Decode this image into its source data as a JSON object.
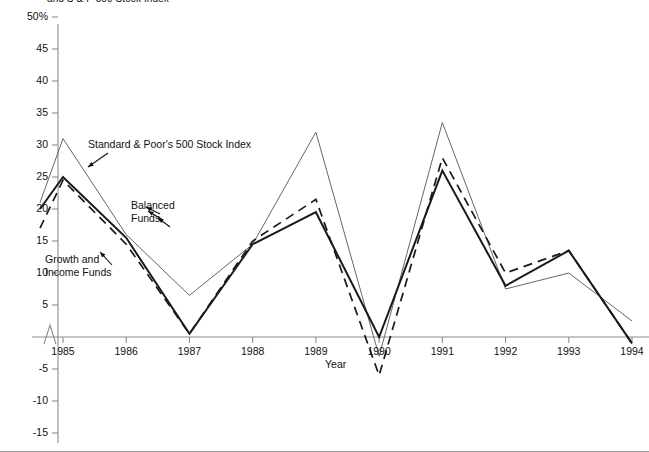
{
  "figure": {
    "title": "and S & P 500 Stock Index",
    "axis_label_x": "Year",
    "axis_break_symbol": "zigzag-break"
  },
  "annotations": {
    "sp500": "Standard & Poor's 500 Stock Index",
    "balanced": "Balanced\nFunds",
    "growth_income": "Growth and\nIncome Funds"
  },
  "chart_data": {
    "type": "line",
    "title": "and S & P 500 Stock Index",
    "xlabel": "Year",
    "ylabel": "",
    "grid": false,
    "legend_position": "inline-annotations",
    "categories": [
      1985,
      1986,
      1987,
      1988,
      1989,
      1990,
      1991,
      1992,
      1993,
      1994
    ],
    "x": [
      "1985",
      "1986",
      "1987",
      "1988",
      "1989",
      "1990",
      "1991",
      "1992",
      "1993",
      "1994"
    ],
    "xlim": [
      1984.4,
      1994
    ],
    "ylim": [
      -15,
      50
    ],
    "ytick_labels": [
      "50%",
      "45",
      "40",
      "35",
      "30",
      "25",
      "20",
      "15",
      "10",
      "5",
      "-5",
      "-10",
      "-15"
    ],
    "ytick_values": [
      50,
      45,
      40,
      35,
      30,
      25,
      20,
      15,
      10,
      5,
      -5,
      -10,
      -15
    ],
    "y_axis_break_between": [
      0,
      5
    ],
    "series": [
      {
        "name": "Standard & Poor's 500 Stock Index",
        "style": "thin-solid",
        "start_value": 21,
        "values": [
          31,
          16,
          6.5,
          14.5,
          32,
          -3,
          33.5,
          7.5,
          10,
          2.5
        ]
      },
      {
        "name": "Balanced Funds",
        "style": "thick-solid",
        "start_value": 20,
        "values": [
          25,
          15.5,
          0.5,
          14.5,
          19.5,
          0,
          26,
          8,
          13.5,
          -1
        ]
      },
      {
        "name": "Growth and Income Funds",
        "style": "dashed",
        "start_value": 17,
        "values": [
          24.5,
          14.5,
          0.5,
          15,
          21.5,
          -6,
          28,
          10,
          13.5,
          -1
        ]
      }
    ]
  }
}
